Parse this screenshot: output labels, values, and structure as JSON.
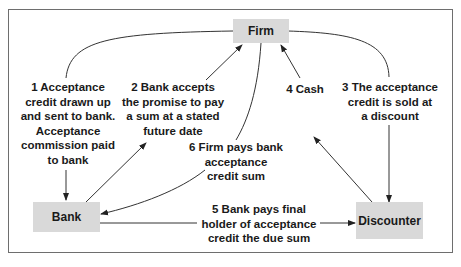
{
  "diagram": {
    "nodes": {
      "firm": "Firm",
      "bank": "Bank",
      "discounter": "Discounter"
    },
    "steps": [
      {
        "number": "1",
        "text": "1 Acceptance\ncredit drawn up\nand sent to bank.\nAcceptance\ncommission paid\nto bank"
      },
      {
        "number": "2",
        "text": "2 Bank accepts\nthe promise to pay\na sum at a stated\nfuture date"
      },
      {
        "number": "3",
        "text": "3 The acceptance\ncredit is sold at\na discount"
      },
      {
        "number": "4",
        "text": "4 Cash"
      },
      {
        "number": "5",
        "text": "5 Bank pays final\nholder of acceptance\ncredit the due sum"
      },
      {
        "number": "6",
        "text": "6 Firm pays bank\nacceptance\ncredit sum"
      }
    ],
    "colors": {
      "node_fill": "#d9d9d9",
      "line": "#333333",
      "frame": "#6e6e6e"
    }
  }
}
